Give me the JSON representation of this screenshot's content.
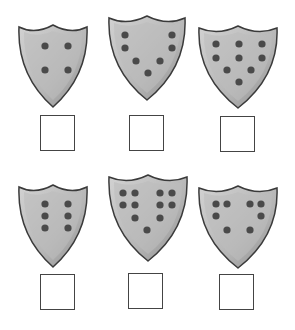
{
  "worksheet": {
    "shield_fill": "#b8b8b8",
    "shield_edge": "#3a3a3a",
    "dot_color": "#4a4a4a",
    "shields": [
      {
        "dots": 4,
        "x": 17,
        "y": 23,
        "box": {
          "x": 40,
          "y": 115
        },
        "answer": ""
      },
      {
        "dots": 7,
        "x": 107,
        "y": 14,
        "box": {
          "x": 129,
          "y": 115
        },
        "answer": ""
      },
      {
        "dots": 9,
        "x": 197,
        "y": 24,
        "box": {
          "x": 220,
          "y": 116
        },
        "answer": ""
      },
      {
        "dots": 6,
        "x": 17,
        "y": 183,
        "box": {
          "x": 40,
          "y": 274
        },
        "answer": ""
      },
      {
        "dots": 11,
        "x": 107,
        "y": 173,
        "box": {
          "x": 128,
          "y": 273
        },
        "answer": ""
      },
      {
        "dots": 8,
        "x": 197,
        "y": 184,
        "box": {
          "x": 219,
          "y": 274
        },
        "answer": ""
      }
    ]
  }
}
